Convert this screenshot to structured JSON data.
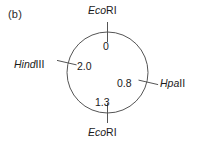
{
  "figure": {
    "panel_label": "(b)",
    "type": "circular-restriction-map",
    "line_color": "#555555",
    "text_color": "#1a1a1a",
    "background_color": "#ffffff"
  },
  "map": {
    "unit": "kb",
    "total_size": "2.0",
    "sites": [
      {
        "id": "ecori-top",
        "enzyme_genus": "Eco",
        "enzyme_numeral": "RI",
        "full_name": "EcoRI",
        "position_label": "0",
        "angle_deg": 0,
        "label_side": "top"
      },
      {
        "id": "hpaii",
        "enzyme_genus": "Hpa",
        "enzyme_numeral": "II",
        "full_name": "HpaII",
        "position_label": "0.8",
        "angle_deg": 100,
        "label_side": "right"
      },
      {
        "id": "ecori-bottom",
        "enzyme_genus": "Eco",
        "enzyme_numeral": "RI",
        "full_name": "EcoRI",
        "position_label": "1.3",
        "angle_deg": 180,
        "label_side": "bottom"
      },
      {
        "id": "hindiii",
        "enzyme_genus": "Hind",
        "enzyme_numeral": "III",
        "full_name": "HindIII",
        "position_label": "2.0",
        "angle_deg": 260,
        "label_side": "left"
      }
    ]
  }
}
